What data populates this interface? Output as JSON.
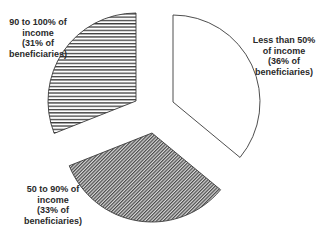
{
  "chart_data": {
    "type": "pie",
    "title": "",
    "exploded": true,
    "start_angle_deg": 0,
    "direction": "clockwise",
    "slices": [
      {
        "name": "Less than 50% of income",
        "value": 36,
        "label_lines": [
          "Less than 50%",
          "of income",
          "(36% of",
          "beneficiaries)"
        ],
        "fill": "white",
        "pattern": "none",
        "vertex": [
          173,
          102
        ],
        "radius": 87,
        "label_pos": [
          284,
          35
        ]
      },
      {
        "name": "50 to 90% of income",
        "value": 33,
        "label_lines": [
          "50 to 90% of",
          "income",
          "(33% of",
          "beneficiaries)"
        ],
        "fill": "#8c8c8c",
        "pattern": "diagonal",
        "vertex": [
          152,
          133
        ],
        "radius": 89,
        "label_pos": [
          53,
          184
        ]
      },
      {
        "name": "90 to 100% of income",
        "value": 31,
        "label_lines": [
          "90 to 100% of",
          "income",
          "(31% of",
          "beneficiaries)"
        ],
        "fill": "#555555",
        "pattern": "horizontal",
        "vertex": [
          136,
          101
        ],
        "radius": 88,
        "label_pos": [
          38,
          17
        ]
      }
    ],
    "categories": [
      "Less than 50% of income",
      "50 to 90% of income",
      "90 to 100% of income"
    ],
    "values": [
      36,
      33,
      31
    ],
    "unit": "% of beneficiaries",
    "legend": "none (direct labels)"
  },
  "colors": {
    "outline": "#3a3a3a",
    "text": "#2a2a2a",
    "background": "#ffffff"
  }
}
